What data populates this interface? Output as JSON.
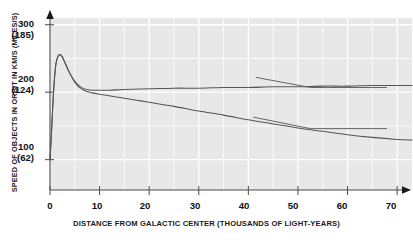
{
  "chart_data": {
    "type": "line",
    "title": "",
    "xlabel": "DISTANCE FROM GALACTIC CENTER (THOUSANDS OF LIGHT-YEARS)",
    "ylabel": "SPEED OF OBJECTS IN ORBIT IN KM/S (MILES/S)",
    "xlim": [
      0,
      73
    ],
    "ylim": [
      55,
      310
    ],
    "grid": true,
    "legend": "annotations-inline",
    "xticks": [
      {
        "value": 0,
        "label": "0"
      },
      {
        "value": 10,
        "label": "10"
      },
      {
        "value": 20,
        "label": "20"
      },
      {
        "value": 30,
        "label": "30"
      },
      {
        "value": 40,
        "label": "40"
      },
      {
        "value": 50,
        "label": "50"
      },
      {
        "value": 60,
        "label": "60"
      },
      {
        "value": 70,
        "label": "70"
      }
    ],
    "yticks": [
      {
        "value": 300,
        "label": "300",
        "paren": "(185)"
      },
      {
        "value": 200,
        "label": "200",
        "paren": "(124)"
      },
      {
        "value": 100,
        "label": "100",
        "paren": "(62)"
      }
    ],
    "series": [
      {
        "name": "Observed rotation curve of Milky Way",
        "annotation": [
          "Observed",
          "rotation curve",
          "of Milky Way"
        ],
        "color": "#555555",
        "points": [
          [
            0.0,
            100
          ],
          [
            0.3,
            140
          ],
          [
            0.6,
            185
          ],
          [
            0.9,
            220
          ],
          [
            1.2,
            242
          ],
          [
            1.6,
            253
          ],
          [
            2.0,
            256
          ],
          [
            2.5,
            252
          ],
          [
            3.0,
            244
          ],
          [
            3.6,
            234
          ],
          [
            4.2,
            225
          ],
          [
            5.0,
            216
          ],
          [
            5.8,
            210
          ],
          [
            6.6,
            206
          ],
          [
            7.4,
            204
          ],
          [
            8.5,
            203
          ],
          [
            10.0,
            203
          ],
          [
            12.0,
            203
          ],
          [
            15.0,
            204
          ],
          [
            20.0,
            205
          ],
          [
            25.0,
            206
          ],
          [
            30.0,
            206
          ],
          [
            35.0,
            207
          ],
          [
            40.0,
            207
          ],
          [
            45.0,
            208
          ],
          [
            50.0,
            208
          ],
          [
            55.0,
            209
          ],
          [
            60.0,
            209
          ],
          [
            65.0,
            210
          ],
          [
            70.0,
            210
          ],
          [
            73.0,
            210
          ]
        ]
      },
      {
        "name": "Slowing effect expected from ordinary matter",
        "annotation": [
          "Slowing effect",
          "expected from",
          "ordinary matter"
        ],
        "color": "#555555",
        "points": [
          [
            0.0,
            100
          ],
          [
            0.3,
            140
          ],
          [
            0.6,
            185
          ],
          [
            0.9,
            220
          ],
          [
            1.2,
            242
          ],
          [
            1.6,
            253
          ],
          [
            2.0,
            256
          ],
          [
            2.5,
            252
          ],
          [
            3.0,
            244
          ],
          [
            3.6,
            234
          ],
          [
            4.2,
            225
          ],
          [
            5.0,
            215
          ],
          [
            5.8,
            208
          ],
          [
            6.6,
            204
          ],
          [
            7.4,
            201
          ],
          [
            8.5,
            199
          ],
          [
            10.0,
            197
          ],
          [
            12.5,
            194
          ],
          [
            15.0,
            191
          ],
          [
            17.5,
            188
          ],
          [
            20.0,
            185
          ],
          [
            25.0,
            179
          ],
          [
            30.0,
            172
          ],
          [
            35.0,
            166
          ],
          [
            40.0,
            159
          ],
          [
            45.0,
            153
          ],
          [
            50.0,
            147
          ],
          [
            55.0,
            142
          ],
          [
            60.0,
            137
          ],
          [
            65.0,
            133
          ],
          [
            70.0,
            130
          ],
          [
            73.0,
            129
          ]
        ]
      }
    ],
    "annotations": [
      {
        "id": "observed-label",
        "lines": [
          "Observed",
          "rotation curve",
          "of Milky Way"
        ],
        "leader_from": [
          52.5,
          207
        ],
        "leader_to": [
          41.5,
          222
        ]
      },
      {
        "id": "ordinary-matter-label",
        "lines": [
          "Slowing effect",
          "expected from",
          "ordinary matter"
        ],
        "leader_from": [
          52.5,
          146
        ],
        "leader_to": [
          41.0,
          163
        ]
      }
    ]
  },
  "axis": {
    "y_title": "SPEED OF OBJECTS IN ORBIT IN KM/S (MILES/S)",
    "x_title": "DISTANCE FROM GALACTIC CENTER (THOUSANDS OF LIGHT-YEARS)"
  },
  "colors": {
    "plot_background": "#e8e8e8",
    "gridline": "#ffffff",
    "curve": "#555555",
    "axis": "#4a4a4a",
    "text": "#111111"
  }
}
